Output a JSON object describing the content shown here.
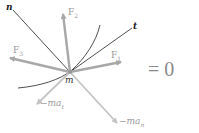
{
  "labels": {
    "n": "n",
    "t": "t",
    "m": "m",
    "F1": "F",
    "F1_sub": "1",
    "F2": "F",
    "F2_sub": "2",
    "F3": "F",
    "F3_sub": "3",
    "mat": "−ma",
    "mat_sub": "t",
    "man": "−ma",
    "man_sub": "n"
  },
  "equation": "= 0",
  "colors": {
    "force_arrow": "#a8a8a8",
    "inertia_arrow": "#c4c4c4",
    "axis_line": "#222222",
    "curve": "#222222",
    "label_gray": "#9a9a9a"
  }
}
